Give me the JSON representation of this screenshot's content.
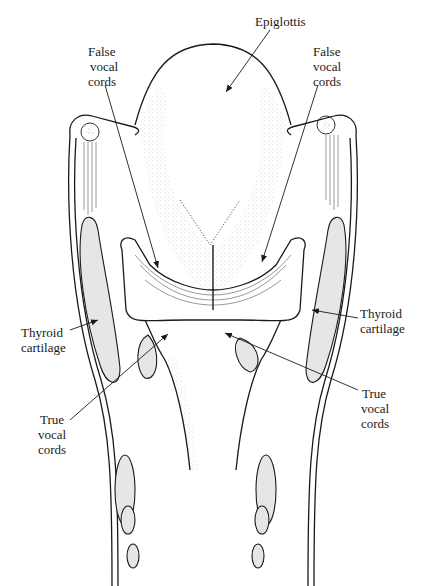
{
  "diagram": {
    "type": "anatomical-illustration",
    "labels": {
      "epiglottis": "Epiglottis",
      "false_vocal_cords_left": [
        "False",
        "vocal",
        "cords"
      ],
      "false_vocal_cords_right": [
        "False",
        "vocal",
        "cords"
      ],
      "thyroid_cartilage_left": [
        "Thyroid",
        "cartilage"
      ],
      "thyroid_cartilage_right": [
        "Thyroid",
        "cartilage"
      ],
      "true_vocal_cords_left": [
        "True",
        "vocal",
        "cords"
      ],
      "true_vocal_cords_right": [
        "True",
        "vocal",
        "cords"
      ]
    },
    "colors": {
      "line": "#1a1a1a",
      "cartilage_fill": "#e6e6e6",
      "background": "#ffffff"
    }
  }
}
